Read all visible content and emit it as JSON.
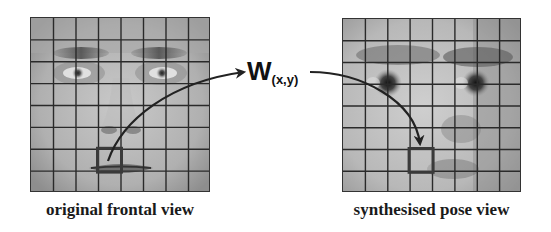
{
  "figure": {
    "left_panel": {
      "caption": "original frontal view",
      "grid": {
        "rows": 8,
        "cols": 8
      },
      "highlight_cell": {
        "row": 6,
        "col": 3
      }
    },
    "right_panel": {
      "caption": "synthesised pose view",
      "grid": {
        "rows": 8,
        "cols": 8
      },
      "highlight_cell": {
        "row": 6,
        "col": 3
      }
    },
    "warp_label": {
      "main": "W",
      "subscript": "(x,y)"
    },
    "colors": {
      "grid_line": "#2a2a2a",
      "highlight_box": "#3a3a3a",
      "arrow": "#222222",
      "background": "#ffffff"
    }
  }
}
